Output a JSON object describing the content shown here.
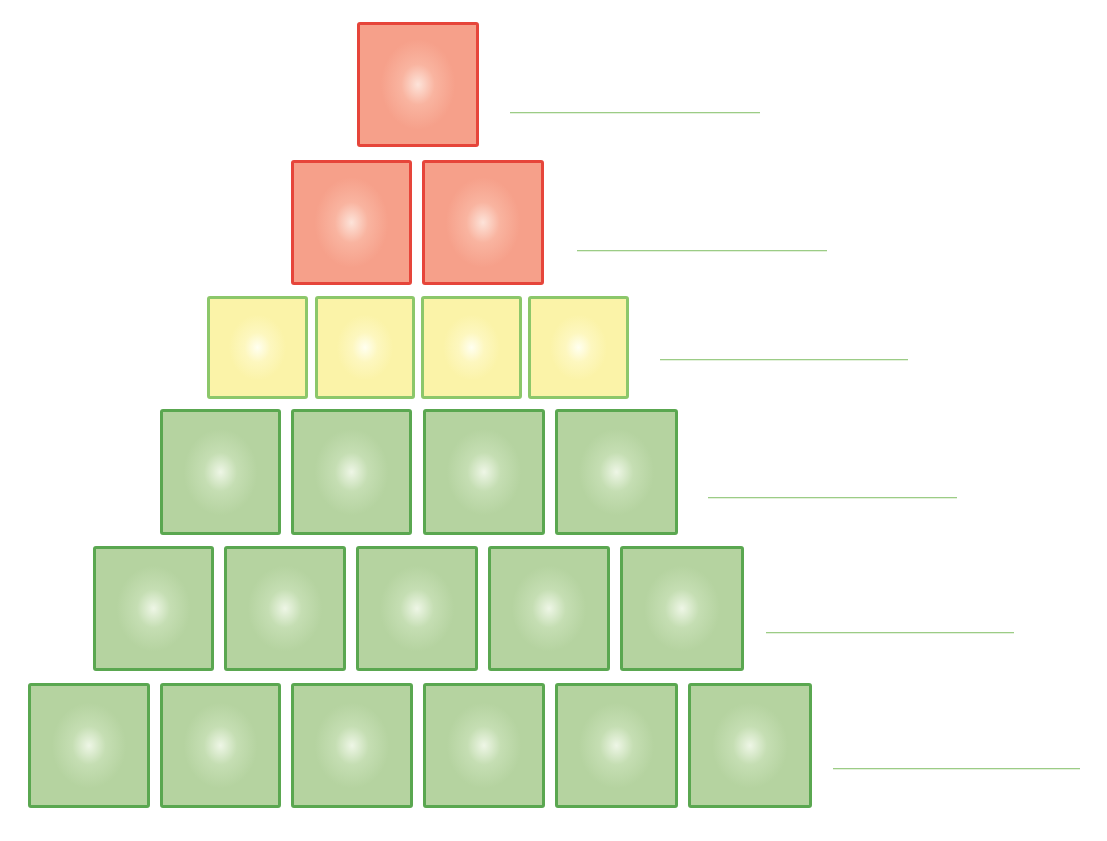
{
  "diagram": {
    "type": "block-pyramid-worksheet",
    "colors": {
      "red_fill": "#f6a08a",
      "red_border": "#e6453a",
      "yellow_fill": "#fbf3a8",
      "yellow_border": "#8cc76a",
      "green_fill": "#b5d3a0",
      "green_border": "#5aa750",
      "answer_line": "#9ccc86"
    },
    "rows": [
      {
        "level": 1,
        "color": "red",
        "block_count": 1,
        "top": 22,
        "height": 125,
        "blocks": [
          {
            "left": 357,
            "width": 122
          }
        ],
        "answer_line": {
          "left": 510,
          "right": 760,
          "y": 112
        }
      },
      {
        "level": 2,
        "color": "red",
        "block_count": 2,
        "top": 160,
        "height": 125,
        "blocks": [
          {
            "left": 291,
            "width": 121
          },
          {
            "left": 422,
            "width": 122
          }
        ],
        "answer_line": {
          "left": 577,
          "right": 827,
          "y": 250
        }
      },
      {
        "level": 3,
        "color": "yellow",
        "block_count": 4,
        "top": 296,
        "height": 103,
        "blocks": [
          {
            "left": 207,
            "width": 101
          },
          {
            "left": 315,
            "width": 100
          },
          {
            "left": 421,
            "width": 101
          },
          {
            "left": 528,
            "width": 101
          }
        ],
        "answer_line": {
          "left": 660,
          "right": 908,
          "y": 359
        }
      },
      {
        "level": 4,
        "color": "green",
        "block_count": 4,
        "top": 409,
        "height": 126,
        "blocks": [
          {
            "left": 160,
            "width": 121
          },
          {
            "left": 291,
            "width": 121
          },
          {
            "left": 423,
            "width": 122
          },
          {
            "left": 555,
            "width": 123
          }
        ],
        "answer_line": {
          "left": 708,
          "right": 957,
          "y": 497
        }
      },
      {
        "level": 5,
        "color": "green",
        "block_count": 5,
        "top": 546,
        "height": 125,
        "blocks": [
          {
            "left": 93,
            "width": 121
          },
          {
            "left": 224,
            "width": 122
          },
          {
            "left": 356,
            "width": 122
          },
          {
            "left": 488,
            "width": 122
          },
          {
            "left": 620,
            "width": 124
          }
        ],
        "answer_line": {
          "left": 766,
          "right": 1014,
          "y": 632
        }
      },
      {
        "level": 6,
        "color": "green",
        "block_count": 6,
        "top": 683,
        "height": 125,
        "blocks": [
          {
            "left": 28,
            "width": 122
          },
          {
            "left": 160,
            "width": 121
          },
          {
            "left": 291,
            "width": 122
          },
          {
            "left": 423,
            "width": 122
          },
          {
            "left": 555,
            "width": 123
          },
          {
            "left": 688,
            "width": 124
          }
        ],
        "answer_line": {
          "left": 833,
          "right": 1080,
          "y": 768
        }
      }
    ]
  }
}
